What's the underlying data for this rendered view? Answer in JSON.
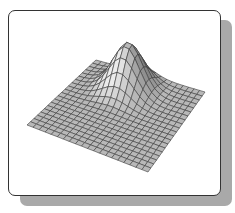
{
  "figure": {
    "type": "3d-mesh-surface",
    "grid_size": 20,
    "corners": {
      "left": [
        27,
        125
      ],
      "top": [
        96,
        60
      ],
      "right": [
        205,
        92
      ],
      "bottom": [
        148,
        172
      ]
    },
    "peak": {
      "u": 0.42,
      "v": 0.22,
      "height": 46,
      "spread": 0.12
    },
    "colors": {
      "face": "#b8b8b8",
      "line": "#3a3a3a",
      "shadow": "#a9a9a9",
      "border": "#333333"
    }
  }
}
